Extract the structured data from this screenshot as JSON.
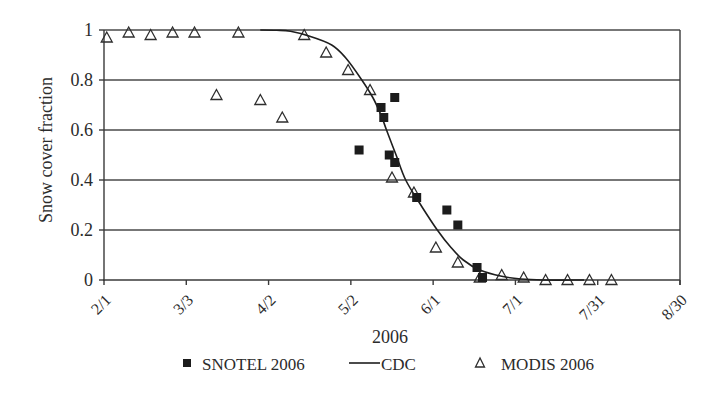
{
  "chart_data": {
    "type": "scatter",
    "title": "",
    "xlabel": "2006",
    "ylabel": "Snow cover fraction",
    "ylim": [
      0,
      1
    ],
    "xlim_days_from_feb1": [
      0,
      210
    ],
    "grid": "horizontal",
    "x_ticks": [
      {
        "label": "2/1",
        "day": 0
      },
      {
        "label": "3/3",
        "day": 30
      },
      {
        "label": "4/2",
        "day": 60
      },
      {
        "label": "5/2",
        "day": 90
      },
      {
        "label": "6/1",
        "day": 120
      },
      {
        "label": "7/1",
        "day": 150
      },
      {
        "label": "7/31",
        "day": 180
      },
      {
        "label": "8/30",
        "day": 210
      }
    ],
    "y_ticks": [
      {
        "label": "0",
        "value": 0
      },
      {
        "label": "0.2",
        "value": 0.2
      },
      {
        "label": "0.4",
        "value": 0.4
      },
      {
        "label": "0.6",
        "value": 0.6
      },
      {
        "label": "0.8",
        "value": 0.8
      },
      {
        "label": "1",
        "value": 1
      }
    ],
    "legend": {
      "position": "bottom",
      "entries": [
        {
          "label": "SNOTEL 2006",
          "marker": "filled-square"
        },
        {
          "label": "CDC",
          "marker": "line"
        },
        {
          "label": "MODIS 2006",
          "marker": "open-triangle"
        }
      ]
    },
    "series": [
      {
        "name": "SNOTEL 2006",
        "kind": "scatter",
        "marker": "filled-square",
        "points": [
          {
            "date": "5/5",
            "day": 93,
            "value": 0.52
          },
          {
            "date": "5/13",
            "day": 101,
            "value": 0.69
          },
          {
            "date": "5/14",
            "day": 102,
            "value": 0.65
          },
          {
            "date": "5/16",
            "day": 104,
            "value": 0.5
          },
          {
            "date": "5/18",
            "day": 106,
            "value": 0.73
          },
          {
            "date": "5/18",
            "day": 106,
            "value": 0.47
          },
          {
            "date": "5/26",
            "day": 114,
            "value": 0.33
          },
          {
            "date": "6/6",
            "day": 125,
            "value": 0.28
          },
          {
            "date": "6/10",
            "day": 129,
            "value": 0.22
          },
          {
            "date": "6/17",
            "day": 136,
            "value": 0.05
          },
          {
            "date": "6/19",
            "day": 138,
            "value": 0.01
          }
        ]
      },
      {
        "name": "CDC",
        "kind": "line",
        "points": [
          {
            "day": 57,
            "value": 1.0
          },
          {
            "day": 63,
            "value": 0.999
          },
          {
            "day": 68,
            "value": 0.995
          },
          {
            "day": 75,
            "value": 0.975
          },
          {
            "day": 83,
            "value": 0.94
          },
          {
            "day": 88,
            "value": 0.89
          },
          {
            "day": 94,
            "value": 0.8
          },
          {
            "day": 98,
            "value": 0.73
          },
          {
            "day": 101,
            "value": 0.66
          },
          {
            "day": 103,
            "value": 0.6
          },
          {
            "day": 106.5,
            "value": 0.5
          },
          {
            "day": 110,
            "value": 0.4
          },
          {
            "day": 115.5,
            "value": 0.3
          },
          {
            "day": 121.5,
            "value": 0.2
          },
          {
            "day": 126.5,
            "value": 0.13
          },
          {
            "day": 131,
            "value": 0.08
          },
          {
            "day": 137,
            "value": 0.04
          },
          {
            "day": 145,
            "value": 0.015
          },
          {
            "day": 152,
            "value": 0.004
          },
          {
            "day": 160,
            "value": 0.0
          },
          {
            "day": 175,
            "value": 0.0
          }
        ]
      },
      {
        "name": "MODIS 2006",
        "kind": "scatter",
        "marker": "open-triangle",
        "points": [
          {
            "date": "2/2",
            "day": 1,
            "value": 0.97
          },
          {
            "date": "2/10",
            "day": 9,
            "value": 0.99
          },
          {
            "date": "2/18",
            "day": 17,
            "value": 0.98
          },
          {
            "date": "2/26",
            "day": 25,
            "value": 0.99
          },
          {
            "date": "3/6",
            "day": 33,
            "value": 0.99
          },
          {
            "date": "3/14",
            "day": 41,
            "value": 0.74
          },
          {
            "date": "3/22",
            "day": 49,
            "value": 0.99
          },
          {
            "date": "3/30",
            "day": 57,
            "value": 0.72
          },
          {
            "date": "4/7",
            "day": 65,
            "value": 0.65
          },
          {
            "date": "4/15",
            "day": 73,
            "value": 0.98
          },
          {
            "date": "4/23",
            "day": 81,
            "value": 0.91
          },
          {
            "date": "5/1",
            "day": 89,
            "value": 0.84
          },
          {
            "date": "5/9",
            "day": 97,
            "value": 0.76
          },
          {
            "date": "5/17",
            "day": 105,
            "value": 0.41
          },
          {
            "date": "5/25",
            "day": 113,
            "value": 0.35
          },
          {
            "date": "6/2",
            "day": 121,
            "value": 0.13
          },
          {
            "date": "6/10",
            "day": 129,
            "value": 0.07
          },
          {
            "date": "6/18",
            "day": 137,
            "value": 0.01
          },
          {
            "date": "6/26",
            "day": 145,
            "value": 0.02
          },
          {
            "date": "7/4",
            "day": 153,
            "value": 0.01
          },
          {
            "date": "7/12",
            "day": 161,
            "value": 0.0
          },
          {
            "date": "7/20",
            "day": 169,
            "value": 0.0
          },
          {
            "date": "7/28",
            "day": 177,
            "value": 0.0
          },
          {
            "date": "8/5",
            "day": 185,
            "value": 0.0
          }
        ]
      }
    ]
  }
}
